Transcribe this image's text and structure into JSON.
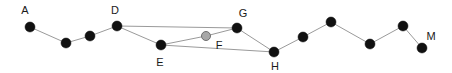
{
  "diagram": {
    "type": "node-link-graph",
    "canvas": {
      "width": 452,
      "height": 73,
      "background": "#ffffff"
    },
    "style": {
      "node_fill": "#111111",
      "node_highlight_fill": "#a8a8a8",
      "node_stroke": "#111111",
      "edge_color": "#9a9a9a",
      "edge_width": 1,
      "node_radius": 5,
      "highlight_node_radius": 4.5,
      "label_color": "#1a1a1a",
      "label_size": 11
    },
    "nodes": [
      {
        "id": "A",
        "label": "A",
        "x": 30,
        "y": 27,
        "fill": "#111111",
        "r": 5,
        "label_x": 25,
        "label_y": 11,
        "labeled": true
      },
      {
        "id": "B",
        "label": "",
        "x": 66,
        "y": 43,
        "fill": "#111111",
        "r": 5,
        "label_x": 66,
        "label_y": 43,
        "labeled": false
      },
      {
        "id": "C",
        "label": "",
        "x": 90,
        "y": 36,
        "fill": "#111111",
        "r": 5,
        "label_x": 90,
        "label_y": 36,
        "labeled": false
      },
      {
        "id": "D",
        "label": "D",
        "x": 117,
        "y": 26,
        "fill": "#111111",
        "r": 5,
        "label_x": 115,
        "label_y": 11,
        "labeled": true
      },
      {
        "id": "E",
        "label": "E",
        "x": 161,
        "y": 45,
        "fill": "#111111",
        "r": 5,
        "label_x": 160,
        "label_y": 63,
        "labeled": true
      },
      {
        "id": "F",
        "label": "F",
        "x": 206,
        "y": 36,
        "fill": "#a8a8a8",
        "r": 4.5,
        "label_x": 219,
        "label_y": 46,
        "labeled": true
      },
      {
        "id": "G",
        "label": "G",
        "x": 237,
        "y": 28,
        "fill": "#111111",
        "r": 5,
        "label_x": 243,
        "label_y": 14,
        "labeled": true
      },
      {
        "id": "H",
        "label": "H",
        "x": 274,
        "y": 52,
        "fill": "#111111",
        "r": 5,
        "label_x": 275,
        "label_y": 67,
        "labeled": true
      },
      {
        "id": "I",
        "label": "",
        "x": 303,
        "y": 37,
        "fill": "#111111",
        "r": 5,
        "label_x": 303,
        "label_y": 37,
        "labeled": false
      },
      {
        "id": "J",
        "label": "",
        "x": 331,
        "y": 22,
        "fill": "#111111",
        "r": 5,
        "label_x": 331,
        "label_y": 22,
        "labeled": false
      },
      {
        "id": "K",
        "label": "",
        "x": 370,
        "y": 44,
        "fill": "#111111",
        "r": 5,
        "label_x": 370,
        "label_y": 44,
        "labeled": false
      },
      {
        "id": "L",
        "label": "",
        "x": 403,
        "y": 26,
        "fill": "#111111",
        "r": 5,
        "label_x": 403,
        "label_y": 26,
        "labeled": false
      },
      {
        "id": "M",
        "label": "M",
        "x": 422,
        "y": 48,
        "fill": "#111111",
        "r": 5,
        "label_x": 431,
        "label_y": 37,
        "labeled": true
      }
    ],
    "edges": [
      {
        "from": "A",
        "to": "B"
      },
      {
        "from": "B",
        "to": "C"
      },
      {
        "from": "C",
        "to": "D"
      },
      {
        "from": "D",
        "to": "E"
      },
      {
        "from": "D",
        "to": "G"
      },
      {
        "from": "E",
        "to": "F"
      },
      {
        "from": "F",
        "to": "G"
      },
      {
        "from": "E",
        "to": "H"
      },
      {
        "from": "G",
        "to": "H"
      },
      {
        "from": "H",
        "to": "I"
      },
      {
        "from": "I",
        "to": "J"
      },
      {
        "from": "J",
        "to": "K"
      },
      {
        "from": "K",
        "to": "L"
      },
      {
        "from": "L",
        "to": "M"
      }
    ]
  }
}
